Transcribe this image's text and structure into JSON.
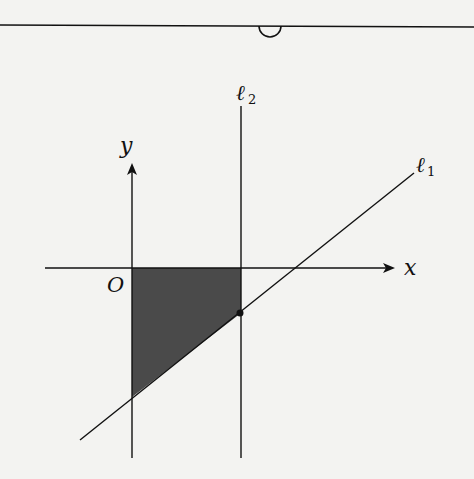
{
  "diagram": {
    "labels": {
      "y_axis": "y",
      "x_axis": "x",
      "origin": "O",
      "line1_main": "ℓ",
      "line1_sub": "1",
      "line2_main": "ℓ",
      "line2_sub": "2"
    },
    "colors": {
      "ink": "#111111",
      "shade": "#4a4a4a",
      "background": "#f3f3f1"
    },
    "shaded_region": "Region bounded by y-axis, x-axis, line ℓ2, and line ℓ1",
    "marked_point": "Intersection of ℓ1 and ℓ2"
  }
}
